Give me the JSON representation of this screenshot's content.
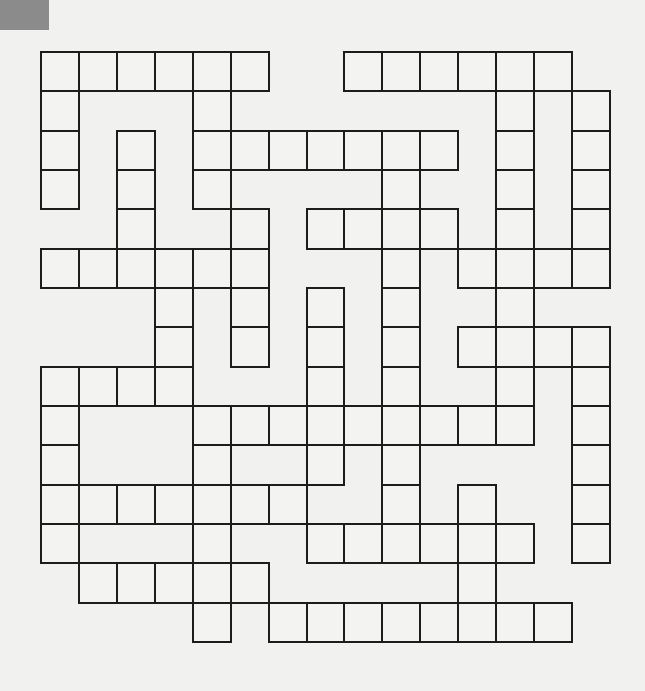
{
  "puzzle": {
    "type": "crossword-grid",
    "rows": 15,
    "cols": 15,
    "line_color": "#1c1c1c",
    "cell_color": "#f3f3f2",
    "background_color": "#f1f1f0",
    "corner_tab_color": "#8b8b8b",
    "grid": [
      [
        1,
        1,
        1,
        1,
        1,
        1,
        0,
        0,
        1,
        1,
        1,
        1,
        1,
        1,
        0
      ],
      [
        1,
        0,
        0,
        0,
        1,
        0,
        0,
        0,
        0,
        0,
        0,
        0,
        1,
        0,
        1
      ],
      [
        1,
        0,
        1,
        0,
        1,
        1,
        1,
        1,
        1,
        1,
        1,
        0,
        1,
        0,
        1
      ],
      [
        1,
        0,
        1,
        0,
        1,
        0,
        0,
        0,
        0,
        1,
        0,
        0,
        1,
        0,
        1
      ],
      [
        0,
        0,
        1,
        0,
        0,
        1,
        0,
        1,
        1,
        1,
        1,
        0,
        1,
        0,
        1
      ],
      [
        1,
        1,
        1,
        1,
        1,
        1,
        0,
        0,
        0,
        1,
        0,
        1,
        1,
        1,
        1
      ],
      [
        0,
        0,
        0,
        1,
        0,
        1,
        0,
        1,
        0,
        1,
        0,
        0,
        1,
        0,
        0
      ],
      [
        0,
        0,
        0,
        1,
        0,
        1,
        0,
        1,
        0,
        1,
        0,
        1,
        1,
        1,
        1
      ],
      [
        1,
        1,
        1,
        1,
        0,
        0,
        0,
        1,
        0,
        1,
        0,
        0,
        1,
        0,
        1
      ],
      [
        1,
        0,
        0,
        0,
        1,
        1,
        1,
        1,
        1,
        1,
        1,
        1,
        1,
        0,
        1
      ],
      [
        1,
        0,
        0,
        0,
        1,
        0,
        0,
        1,
        0,
        1,
        0,
        0,
        0,
        0,
        1
      ],
      [
        1,
        1,
        1,
        1,
        1,
        1,
        1,
        0,
        0,
        1,
        0,
        1,
        0,
        0,
        1
      ],
      [
        1,
        0,
        0,
        0,
        1,
        0,
        0,
        1,
        1,
        1,
        1,
        1,
        1,
        0,
        1
      ],
      [
        0,
        1,
        1,
        1,
        1,
        1,
        0,
        0,
        0,
        0,
        0,
        1,
        0,
        0,
        0
      ],
      [
        0,
        0,
        0,
        0,
        1,
        0,
        1,
        1,
        1,
        1,
        1,
        1,
        1,
        1,
        0
      ]
    ],
    "entries": []
  }
}
